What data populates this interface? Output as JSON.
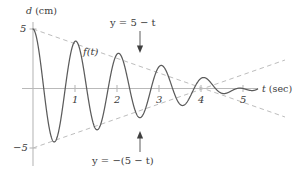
{
  "chart_data": {
    "type": "line",
    "title": "",
    "xlabel": "t (sec)",
    "ylabel": "d (cm)",
    "xlim": [
      -0.15,
      6.0
    ],
    "ylim": [
      -5.8,
      5.8
    ],
    "grid": false,
    "legend": "none",
    "xticks": [
      1,
      2,
      3,
      4,
      5
    ],
    "xtick_labels": [
      "1",
      "2",
      "3",
      "4",
      "5"
    ],
    "yticks": [
      5,
      -5
    ],
    "ytick_labels": [
      "5",
      "-5"
    ],
    "series": [
      {
        "name": "f(t)",
        "kind": "damped-cosine",
        "style": "solid",
        "color": "#595959",
        "annotation": "f(t)",
        "formula_description": "d = (5 - t) cos(2*pi*t / 1.0225)",
        "amplitude_at_t0": 5,
        "zero_amplitude_at_t": 5,
        "period": 1.0225,
        "peaks_t": [
          0,
          1.02,
          2.05,
          3.07,
          4.09
        ],
        "peaks_d": [
          5,
          3.98,
          2.95,
          1.93,
          0.91
        ],
        "troughs_t": [
          0.51,
          1.53,
          2.56,
          3.58
        ],
        "troughs_d": [
          -4.49,
          -3.47,
          -2.44,
          -1.42
        ]
      },
      {
        "name": "y = 5 - t",
        "kind": "envelope-upper",
        "style": "dashed",
        "color": "#b0b0b0",
        "annotation": "y = 5 - t",
        "points": [
          [
            0,
            5
          ],
          [
            5,
            0
          ],
          [
            6,
            -1
          ]
        ]
      },
      {
        "name": "y = -(5 - t)",
        "kind": "envelope-lower",
        "style": "dashed",
        "color": "#b0b0b0",
        "annotation": "y = -(5 - t)",
        "points": [
          [
            0,
            -5
          ],
          [
            5,
            0
          ],
          [
            6,
            1
          ]
        ]
      }
    ]
  },
  "labels": {
    "y_axis_title": "d (cm)",
    "y_axis_title_var": "d",
    "y_axis_title_unit": "(cm)",
    "x_axis_title": "t (sec)",
    "x_axis_title_var": "t",
    "x_axis_title_unit": "(sec)",
    "y_tick_top": "5",
    "y_tick_bottom": "−5",
    "x_tick_1": "1",
    "x_tick_2": "2",
    "x_tick_3": "3",
    "x_tick_4": "4",
    "x_tick_5": "5",
    "function_label": "f(t)",
    "upper_envelope_eq": "y = 5 − t",
    "lower_envelope_eq": "y = −(5 − t)"
  },
  "colors": {
    "background": "#ffffff",
    "axis": "#b8b8b8",
    "curve": "#5b5b5b",
    "envelope": "#b5b5b5",
    "text": "#3b3b3b",
    "arrow": "#4a4a4a"
  }
}
